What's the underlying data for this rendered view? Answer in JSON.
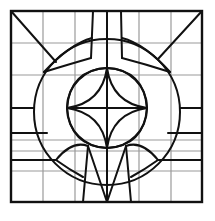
{
  "figure": {
    "colors": {
      "background": "#ffffff",
      "ink": "#111111",
      "grid": "#9a9a9a"
    },
    "frame": {
      "x": 11,
      "y": 11,
      "width": 191,
      "height": 191
    },
    "grid": {
      "vertical_x": [
        43,
        75,
        139,
        171
      ],
      "horizontal_y": [
        43,
        75,
        140,
        151,
        171
      ]
    }
  }
}
